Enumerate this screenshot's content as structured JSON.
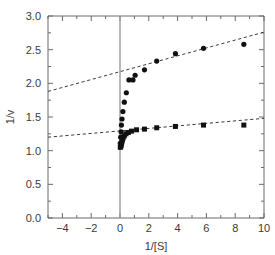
{
  "figure": {
    "background_color": "#ffffff",
    "frame_color": "#6b6b6b",
    "zero_line_color": "#9a9a9a",
    "marker_color": "#111111",
    "fit_line_color": "#3d3d3d"
  },
  "chart_data": {
    "type": "scatter",
    "title": "",
    "subtitle": "",
    "xlabel": "1/[S]",
    "ylabel": "1/v",
    "xlim": [
      -5,
      10
    ],
    "ylim": [
      0.0,
      3.0
    ],
    "grid": false,
    "legend_position": "none",
    "x_ticks": [
      -4,
      -2,
      0,
      2,
      4,
      6,
      8,
      10
    ],
    "x_tick_labels": [
      "−4",
      "−2",
      "0",
      "2",
      "4",
      "6",
      "8",
      "10"
    ],
    "x_minor_tick_step": 1,
    "y_ticks": [
      0.0,
      0.5,
      1.0,
      1.5,
      2.0,
      2.5,
      3.0
    ],
    "y_tick_labels": [
      "0.0",
      "0.5",
      "1.0",
      "1.5",
      "2.0",
      "2.5",
      "3.0"
    ],
    "y_minor_tick_step": 0.25,
    "zero_reference_line_x": 0,
    "annotations": [],
    "series": [
      {
        "name": "upper-series-circles",
        "marker": "circle",
        "marker_size": 5.2,
        "points": [
          {
            "x": 0.02,
            "y": 1.11
          },
          {
            "x": 0.05,
            "y": 1.2
          },
          {
            "x": 0.08,
            "y": 1.28
          },
          {
            "x": 0.1,
            "y": 1.38
          },
          {
            "x": 0.14,
            "y": 1.47
          },
          {
            "x": 0.2,
            "y": 1.58
          },
          {
            "x": 0.3,
            "y": 1.72
          },
          {
            "x": 0.44,
            "y": 1.86
          },
          {
            "x": 0.62,
            "y": 2.05
          },
          {
            "x": 0.9,
            "y": 2.05
          },
          {
            "x": 1.05,
            "y": 2.12
          },
          {
            "x": 1.7,
            "y": 2.2
          },
          {
            "x": 2.55,
            "y": 2.33
          },
          {
            "x": 3.85,
            "y": 2.44
          },
          {
            "x": 5.8,
            "y": 2.52
          },
          {
            "x": 8.6,
            "y": 2.58
          }
        ],
        "fit": {
          "type": "linear",
          "slope": 0.0585,
          "intercept": 2.175,
          "style": "dashed",
          "x_start": -5,
          "x_end": 10,
          "y_at_x_start": 1.88,
          "y_at_x_end": 2.76
        }
      },
      {
        "name": "lower-series-squares",
        "marker": "square",
        "marker_size": 5.0,
        "points": [
          {
            "x": 0.02,
            "y": 1.05
          },
          {
            "x": 0.05,
            "y": 1.06
          },
          {
            "x": 0.07,
            "y": 1.08
          },
          {
            "x": 0.1,
            "y": 1.1
          },
          {
            "x": 0.13,
            "y": 1.13
          },
          {
            "x": 0.17,
            "y": 1.16
          },
          {
            "x": 0.22,
            "y": 1.19
          },
          {
            "x": 0.3,
            "y": 1.22
          },
          {
            "x": 0.42,
            "y": 1.25
          },
          {
            "x": 0.58,
            "y": 1.27
          },
          {
            "x": 0.8,
            "y": 1.29
          },
          {
            "x": 1.15,
            "y": 1.31
          },
          {
            "x": 1.7,
            "y": 1.32
          },
          {
            "x": 2.55,
            "y": 1.34
          },
          {
            "x": 3.85,
            "y": 1.36
          },
          {
            "x": 5.8,
            "y": 1.38
          },
          {
            "x": 8.6,
            "y": 1.38
          }
        ],
        "fit": {
          "type": "linear",
          "slope": 0.0187,
          "intercept": 1.293,
          "style": "dashed",
          "x_start": -5,
          "x_end": 10,
          "y_at_x_start": 1.2,
          "y_at_x_end": 1.48
        }
      }
    ]
  }
}
